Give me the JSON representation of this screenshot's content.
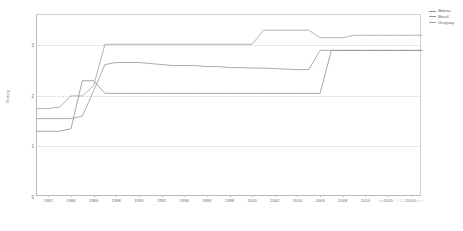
{
  "chart_data": {
    "type": "line",
    "title": "",
    "xlabel": "",
    "ylabel": "Rating",
    "xlim": [
      1981,
      2015
    ],
    "ylim": [
      0,
      3.6
    ],
    "grid": true,
    "legend_position": "top-right",
    "x_ticks": [
      "1982",
      "1984",
      "1986",
      "1988",
      "1990",
      "1992",
      "1994",
      "1996",
      "1998",
      "2000",
      "2002",
      "2004",
      "2006",
      "2008",
      "2010",
      "2012",
      "2014"
    ],
    "y_ticks": [
      "0",
      "1",
      "2",
      "3"
    ],
    "x": [
      1981,
      1982,
      1983,
      1984,
      1985,
      1986,
      1987,
      1988,
      1989,
      1990,
      1991,
      1992,
      1993,
      1994,
      1995,
      1996,
      1997,
      1998,
      1999,
      2000,
      2001,
      2002,
      2003,
      2004,
      2005,
      2006,
      2007,
      2008,
      2009,
      2010,
      2011,
      2012,
      2013,
      2014,
      2015
    ],
    "series": [
      {
        "name": "Bolivia",
        "color": "#8f8f95",
        "values": [
          1.3,
          1.3,
          1.3,
          1.35,
          2.3,
          2.3,
          2.05,
          2.05,
          2.05,
          2.05,
          2.05,
          2.05,
          2.05,
          2.05,
          2.05,
          2.05,
          2.05,
          2.05,
          2.05,
          2.05,
          2.05,
          2.05,
          2.05,
          2.05,
          2.05,
          2.05,
          2.9,
          2.9,
          2.9,
          2.9,
          2.9,
          2.9,
          2.9,
          2.9,
          2.9
        ]
      },
      {
        "name": "Brasil",
        "color": "#97979d",
        "values": [
          1.55,
          1.55,
          1.55,
          1.55,
          1.6,
          2.1,
          2.62,
          2.66,
          2.66,
          2.66,
          2.64,
          2.62,
          2.6,
          2.6,
          2.6,
          2.58,
          2.58,
          2.56,
          2.56,
          2.55,
          2.55,
          2.54,
          2.53,
          2.52,
          2.52,
          2.9,
          2.9,
          2.9,
          2.9,
          2.9,
          2.9,
          2.9,
          2.9,
          2.9,
          2.9
        ]
      },
      {
        "name": "Uruguay",
        "color": "#a0a0a6",
        "values": [
          1.75,
          1.75,
          1.78,
          2.0,
          2.0,
          2.2,
          3.02,
          3.02,
          3.02,
          3.02,
          3.02,
          3.02,
          3.02,
          3.02,
          3.02,
          3.02,
          3.02,
          3.02,
          3.02,
          3.02,
          3.3,
          3.3,
          3.3,
          3.3,
          3.3,
          3.15,
          3.15,
          3.15,
          3.2,
          3.2,
          3.2,
          3.2,
          3.2,
          3.2,
          3.2
        ]
      }
    ],
    "gridline_values": [
      1,
      2,
      3
    ],
    "credit": "ngraph.com - © 2014 data source"
  },
  "legend": {
    "items": [
      "Bolivia",
      "Brasil",
      "Uruguay"
    ]
  }
}
